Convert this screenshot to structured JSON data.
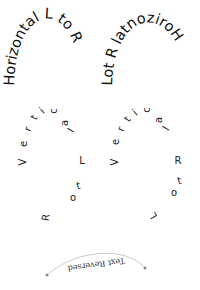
{
  "arcs": {
    "top_left": {
      "text": "Horizontal L to R"
    },
    "top_right": {
      "text": "Lot R latnoziroH"
    }
  },
  "vertical": {
    "left": {
      "label": "Vertical L to R",
      "letters": [
        "V",
        "e",
        "r",
        "t",
        "i",
        "c",
        "a",
        "l",
        "L",
        "t",
        "o",
        "R"
      ]
    },
    "right": {
      "label": "Vertical R to L",
      "letters": [
        "V",
        "e",
        "r",
        "t",
        "i",
        "c",
        "a",
        "l",
        "R",
        "t",
        "o",
        "L"
      ]
    }
  },
  "bottom": {
    "text": "Text Reversed",
    "path_color": "#bbbbbb",
    "marker_color": "#888888"
  }
}
